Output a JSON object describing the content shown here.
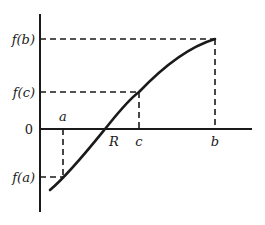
{
  "diagram": {
    "colors": {
      "ink": "#1a1a1a",
      "background": "#ffffff"
    },
    "y_labels": {
      "fb": "f(b)",
      "fc": "f(c)",
      "zero": "0",
      "fa": "f(a)"
    },
    "x_labels": {
      "a": "a",
      "R": "R",
      "c": "c",
      "b": "b"
    },
    "points": [
      {
        "name": "a",
        "x_label": "a",
        "y_label": "f(a)",
        "sign": "negative"
      },
      {
        "name": "R",
        "x_label": "R",
        "y_label": "0",
        "sign": "root"
      },
      {
        "name": "c",
        "x_label": "c",
        "y_label": "f(c)",
        "sign": "positive"
      },
      {
        "name": "b",
        "x_label": "b",
        "y_label": "f(b)",
        "sign": "positive"
      }
    ]
  }
}
